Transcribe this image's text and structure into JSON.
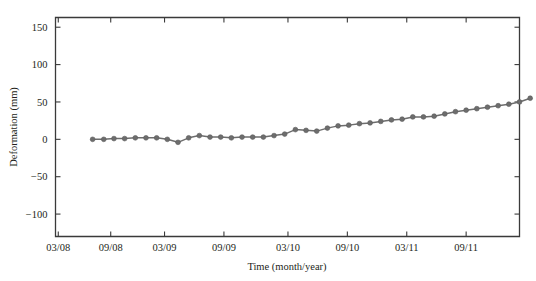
{
  "chart_data": {
    "type": "line",
    "title": "",
    "xlabel": "Time (month/year)",
    "ylabel": "Deformation (mm)",
    "xlim": [
      0,
      100
    ],
    "ylim": [
      -130,
      163
    ],
    "grid": false,
    "legend": null,
    "y_ticks": [
      150,
      100,
      50,
      0,
      -50,
      -100
    ],
    "y_tick_labels": [
      "150",
      "100",
      "50",
      "0",
      "−50",
      "−100"
    ],
    "x_ticks": [
      0.6,
      11.9,
      23.5,
      36.3,
      50.1,
      62.9,
      75.7,
      88.5,
      101.3
    ],
    "x_tick_labels": [
      "03/08",
      "09/08",
      "03/09",
      "09/09",
      "03/10",
      "09/10",
      "03/11",
      "09/11",
      "03/12"
    ],
    "series": [
      {
        "name": "Deformation",
        "color": "#6d6d6d",
        "marker": "circle",
        "x": [
          8.0,
          10.4,
          12.6,
          14.9,
          17.2,
          19.5,
          21.8,
          24.1,
          26.4,
          28.7,
          31.0,
          33.3,
          35.6,
          37.9,
          40.2,
          42.5,
          44.8,
          47.1,
          49.4,
          51.7,
          54.0,
          56.3,
          58.6,
          60.9,
          63.2,
          65.5,
          67.8,
          70.1,
          72.4,
          74.7,
          77.0,
          79.3,
          81.6,
          83.9,
          86.2,
          88.5,
          90.8,
          93.1,
          95.4,
          97.7,
          100.0,
          102.3
        ],
        "y": [
          0,
          0,
          1,
          1,
          2,
          2,
          2,
          0,
          -4,
          2,
          5,
          3,
          3,
          2,
          3,
          3,
          3,
          5,
          7,
          13,
          12,
          11,
          15,
          18,
          19,
          21,
          22,
          24,
          26,
          27,
          30,
          30,
          31,
          34,
          37,
          39,
          41,
          43,
          45,
          47,
          50,
          55
        ]
      }
    ]
  },
  "figure": {
    "background_color": "#ffffff",
    "axis_color": "#3a3a3a",
    "text_color": "#231f20"
  }
}
